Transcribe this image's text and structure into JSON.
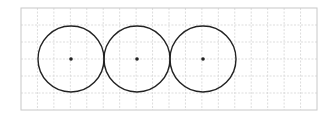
{
  "diagram": {
    "type": "grid-with-circles",
    "grid": {
      "left": 21,
      "top": 8,
      "right": 317,
      "bottom": 110,
      "columns": 18,
      "rows": 6,
      "border_color": "#c8c8c8",
      "line_color": "#d4d4d4",
      "line_style": "dashed"
    },
    "circles": [
      {
        "cx": 71,
        "cy": 59,
        "r": 33,
        "center_dot": true
      },
      {
        "cx": 137,
        "cy": 59,
        "r": 33,
        "center_dot": true
      },
      {
        "cx": 203,
        "cy": 59,
        "r": 33,
        "center_dot": true
      }
    ],
    "circle_stroke": "#222222",
    "dot_color": "#222222"
  }
}
